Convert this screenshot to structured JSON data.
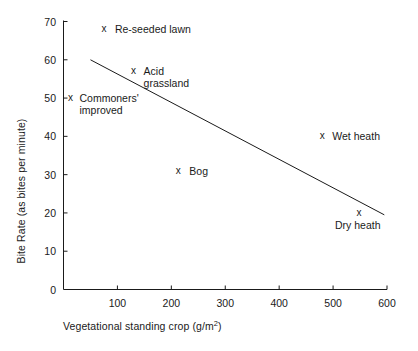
{
  "chart_data": {
    "type": "scatter",
    "title": "",
    "xlabel": "Vegetational standing crop (g/m2)",
    "xlabel_main": "Vegetational standing crop (g/m",
    "xlabel_sup": "2",
    "xlabel_tail": ")",
    "ylabel": "Bite Rate (as bites per minute)",
    "xlim": [
      0,
      600
    ],
    "ylim": [
      0,
      70
    ],
    "grid": false,
    "legend": "none",
    "xticks": [
      "100",
      "200",
      "300",
      "400",
      "500",
      "600"
    ],
    "xtick_values": [
      100,
      200,
      300,
      400,
      500,
      600
    ],
    "yticks": [
      "0",
      "10",
      "20",
      "30",
      "40",
      "50",
      "60",
      "70"
    ],
    "ytick_values": [
      0,
      10,
      20,
      30,
      40,
      50,
      60,
      70
    ],
    "marker_symbol": "x",
    "points": [
      {
        "name": "Re-seeded lawn",
        "label": "Re-seeded lawn",
        "x": 75,
        "y": 68,
        "label_dx": 11,
        "label_dy": -6
      },
      {
        "name": "Acid grassland",
        "label": "Acid\ngrassland",
        "x": 130,
        "y": 57,
        "label_dx": 10,
        "label_dy": -6
      },
      {
        "name": "Commoners' improved",
        "label": "Commoners'\nimproved",
        "x": 13,
        "y": 50,
        "label_dx": 9,
        "label_dy": -6
      },
      {
        "name": "Wet heath",
        "label": "Wet heath",
        "x": 480,
        "y": 40,
        "label_dx": 10,
        "label_dy": -6
      },
      {
        "name": "Bog",
        "label": "Bog",
        "x": 213,
        "y": 31,
        "label_dx": 11,
        "label_dy": -6
      },
      {
        "name": "Dry heath",
        "label": "Dry heath",
        "x": 548,
        "y": 20,
        "label_dx": -24,
        "label_dy": 6
      }
    ],
    "trendline": {
      "name": "fitted-regression-line",
      "x1": 50,
      "y1": 60,
      "x2": 595,
      "y2": 19.5
    }
  }
}
